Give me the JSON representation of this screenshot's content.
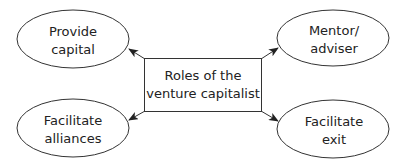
{
  "diagram": {
    "center": {
      "line1": "Roles of the",
      "line2": "venture capitalist"
    },
    "nodes": [
      {
        "id": "provide-capital",
        "line1": "Provide",
        "line2": "capital"
      },
      {
        "id": "mentor-adviser",
        "line1": "Mentor/",
        "line2": "adviser"
      },
      {
        "id": "facilitate-alliances",
        "line1": "Facilitate",
        "line2": "alliances"
      },
      {
        "id": "facilitate-exit",
        "line1": "Facilitate",
        "line2": "exit"
      }
    ],
    "edges": [
      {
        "from": "center",
        "to": "provide-capital"
      },
      {
        "from": "center",
        "to": "mentor-adviser"
      },
      {
        "from": "center",
        "to": "facilitate-alliances"
      },
      {
        "from": "center",
        "to": "facilitate-exit"
      }
    ],
    "colors": {
      "stroke": "#333333",
      "text": "#222222",
      "background": "#ffffff"
    }
  }
}
